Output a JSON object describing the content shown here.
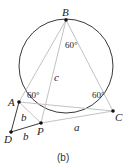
{
  "figure": {
    "caption": "(b)",
    "circle": {
      "cx": 66,
      "cy": 66,
      "r": 47
    },
    "points": {
      "B": {
        "label": "B",
        "x": 66,
        "y": 20
      },
      "A": {
        "label": "A",
        "x": 19,
        "y": 102
      },
      "C": {
        "label": "C",
        "x": 113,
        "y": 111
      },
      "P": {
        "label": "P",
        "x": 41,
        "y": 123
      },
      "D": {
        "label": "D",
        "x": 11,
        "y": 132
      }
    },
    "angles": {
      "at_B": "60°",
      "at_A": "60°",
      "at_C": "60°"
    },
    "segment_labels": {
      "BP": "c",
      "AP": "b",
      "DP": "b",
      "PC": "a"
    },
    "colors": {
      "circle": "#222222",
      "triangle": "#bbbbbb",
      "dark_lines": "#222222"
    }
  }
}
